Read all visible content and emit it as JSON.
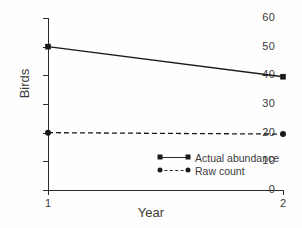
{
  "chart_data": {
    "type": "line",
    "title": "",
    "xlabel": "Year",
    "ylabel": "Birds",
    "x": [
      1,
      2
    ],
    "xticklabels": [
      "1",
      "2"
    ],
    "xlim": [
      1,
      2
    ],
    "ylim": [
      0,
      60
    ],
    "yticks": [
      0,
      10,
      20,
      30,
      40,
      50,
      60
    ],
    "yticklabels": [
      "0",
      "10",
      "20",
      "30",
      "40",
      "50",
      "60"
    ],
    "grid": false,
    "legend_position": "inside-lower-right",
    "series": [
      {
        "name": "Actual abundance",
        "values": [
          50,
          39.5
        ],
        "linestyle": "solid",
        "marker": "square",
        "color": "#1a1a1a"
      },
      {
        "name": "Raw count",
        "values": [
          20,
          19.5
        ],
        "linestyle": "dashed",
        "marker": "circle",
        "color": "#1a1a1a"
      }
    ]
  },
  "legend": {
    "items": [
      {
        "label": "Actual abundance"
      },
      {
        "label": "Raw count"
      }
    ]
  },
  "colors": {
    "axis": "#2b2b2b",
    "text": "#3a3a3a",
    "marker": "#1a1a1a",
    "background": "#fefefe"
  }
}
